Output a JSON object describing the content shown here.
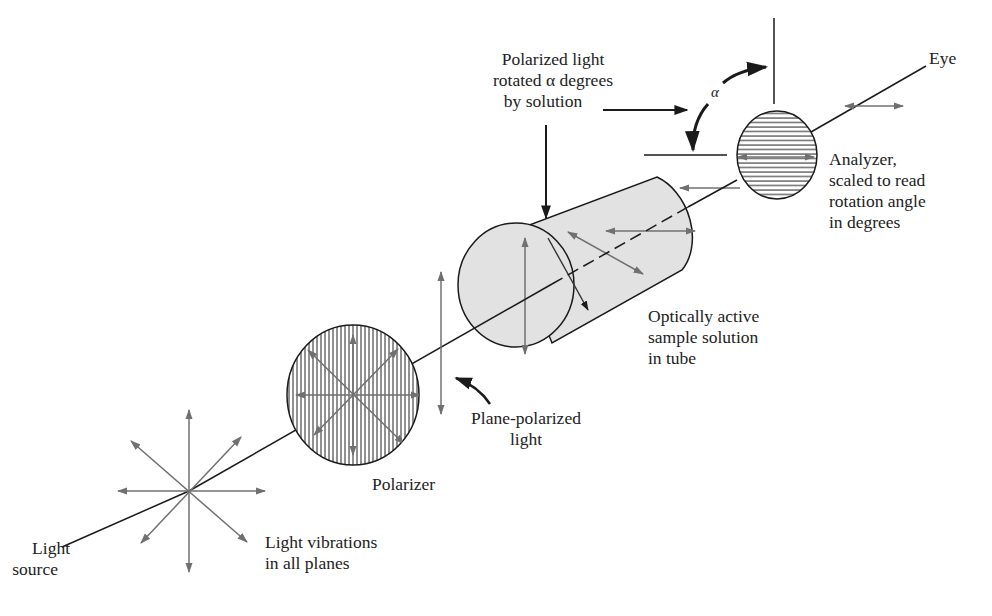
{
  "colors": {
    "ink": "#1a1a1a",
    "arrow_gray": "#707070",
    "tube_fill": "#e2e2e2",
    "background": "#ffffff"
  },
  "labels": {
    "light_source": [
      "Light",
      "source"
    ],
    "light_vibrations": [
      "Light vibrations",
      "in all planes"
    ],
    "polarizer": [
      "Polarizer"
    ],
    "plane_polarized": [
      "Plane-polarized",
      "light"
    ],
    "sample": [
      "Optically active",
      "sample solution",
      "in tube"
    ],
    "rotated": [
      "Polarized light",
      "rotated α degrees",
      "by solution"
    ],
    "analyzer": [
      "Analyzer,",
      "scaled to read",
      "rotation angle",
      "in degrees"
    ],
    "eye": [
      "Eye"
    ],
    "alpha": "α"
  },
  "components": [
    {
      "name": "light-source",
      "label": "Light source"
    },
    {
      "name": "polarizer",
      "label": "Polarizer",
      "hatch": "vertical"
    },
    {
      "name": "sample-tube",
      "label": "Optically active sample solution in tube"
    },
    {
      "name": "analyzer",
      "label": "Analyzer",
      "hatch": "horizontal"
    },
    {
      "name": "eye",
      "label": "Eye"
    }
  ]
}
